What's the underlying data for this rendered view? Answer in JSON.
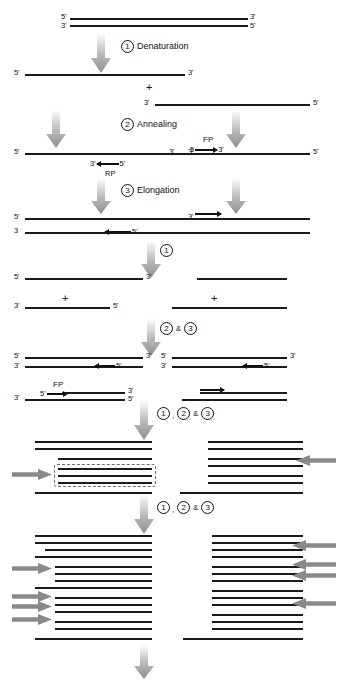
{
  "figure": {
    "colors": {
      "strand": "#1a1a1a",
      "gray_arrow": "#8a8a8a",
      "dash_box": "#6e6e6e",
      "background": "#ffffff"
    }
  },
  "labels": {
    "five_prime": "5'",
    "three_prime": "3'",
    "five_plain": "5",
    "three_plain": "3",
    "plus": "+",
    "ampersand": "&",
    "comma": ",",
    "forward_primer": "FP",
    "reverse_primer": "RP"
  },
  "steps": {
    "one": "1",
    "two": "2",
    "three": "3",
    "denaturation": "Denaturation",
    "annealing": "Annealing",
    "elongation": "Elongation"
  },
  "captions": [
    {
      "id": "caption-denaturation",
      "numbers": [
        "1"
      ],
      "text": "Denaturation"
    },
    {
      "id": "caption-annealing",
      "numbers": [
        "2"
      ],
      "text": "Annealing"
    },
    {
      "id": "caption-elongation",
      "numbers": [
        "3"
      ],
      "text": "Elongation"
    },
    {
      "id": "caption-cycle-1",
      "numbers": [
        "1"
      ],
      "text": ""
    },
    {
      "id": "caption-cycle-2and3",
      "numbers": [
        "2",
        "3"
      ],
      "text": ""
    },
    {
      "id": "caption-cycle-1-2and3-a",
      "numbers": [
        "1",
        "2",
        "3"
      ],
      "text": ""
    },
    {
      "id": "caption-cycle-1-2and3-b",
      "numbers": [
        "1",
        "2",
        "3"
      ],
      "text": ""
    }
  ]
}
